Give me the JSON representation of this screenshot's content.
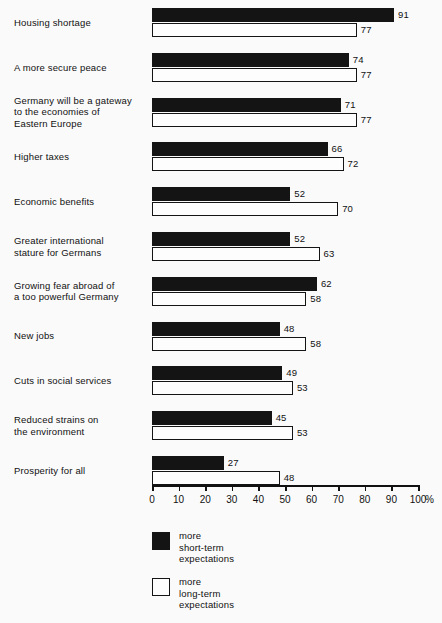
{
  "chart_data": {
    "type": "bar",
    "orientation": "horizontal",
    "title": "",
    "xlabel": "%",
    "ylabel": "",
    "xlim": [
      0,
      100
    ],
    "grid": false,
    "legend_position": "bottom-center",
    "tick_labels": [
      "0",
      "10",
      "20",
      "30",
      "40",
      "50",
      "60",
      "70",
      "80",
      "90",
      "100"
    ],
    "tick_values": [
      0,
      10,
      20,
      30,
      40,
      50,
      60,
      70,
      80,
      90,
      100
    ],
    "axis_unit": "%",
    "categories": [
      "Housing shortage",
      "A more secure peace",
      "Germany will be a gateway\nto the economies of\nEastern Europe",
      "Higher taxes",
      "Economic benefits",
      "Greater international\nstature for Germans",
      "Growing fear abroad of\na too powerful Germany",
      "New jobs",
      "Cuts in social services",
      "Reduced strains on\nthe environment",
      "Prosperity for all"
    ],
    "series": [
      {
        "name": "more\nshort-term\nexpectations",
        "color": "#141414",
        "values": [
          91,
          74,
          71,
          66,
          52,
          52,
          62,
          48,
          49,
          45,
          27
        ]
      },
      {
        "name": "more\nlong-term\nexpectations",
        "color": "#fdfdfd",
        "values": [
          77,
          77,
          77,
          72,
          70,
          63,
          58,
          58,
          53,
          53,
          48
        ]
      }
    ]
  },
  "legend": {
    "items": [
      {
        "label": "more\nshort-term\nexpectations",
        "swatch": "dark"
      },
      {
        "label": "more\nlong-term\nexpectations",
        "swatch": "light"
      }
    ]
  }
}
